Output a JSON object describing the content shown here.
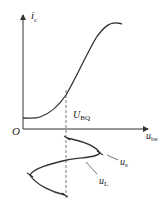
{
  "diagram": {
    "type": "transistor-input-characteristic",
    "colors": {
      "stroke": "#333333",
      "background": "#ffffff"
    },
    "axes": {
      "y_label": {
        "main": "i",
        "sub": "c"
      },
      "x_label": {
        "main": "u",
        "sub": "be"
      },
      "origin_label": "O"
    },
    "quiescent_label": {
      "main": "U",
      "sub": "BQ"
    },
    "signal_labels": {
      "source": {
        "main": "u",
        "sub": "s"
      },
      "load": {
        "main": "u",
        "sub": "L"
      }
    }
  }
}
